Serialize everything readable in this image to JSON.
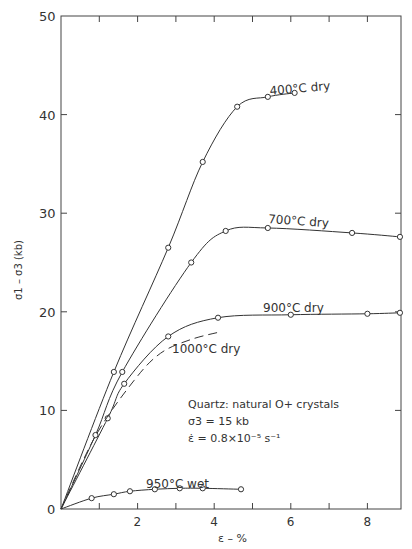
{
  "chart_data": {
    "type": "line",
    "title": "",
    "xlabel": "ε – %",
    "ylabel": "σ1 – σ3 (kb)",
    "xlim": [
      0,
      8.85
    ],
    "ylim": [
      0,
      50
    ],
    "xticks": [
      0,
      1,
      2,
      3,
      4,
      5,
      6,
      7,
      8
    ],
    "xtick_labels": [
      "",
      "",
      "2",
      "",
      "4",
      "",
      "6",
      "",
      "8"
    ],
    "yticks": [
      0,
      10,
      20,
      30,
      40,
      50
    ],
    "ytick_labels": [
      "0",
      "10",
      "20",
      "30",
      "40",
      "50"
    ],
    "grid": false,
    "legend": "none (inline curve labels)",
    "annotation": {
      "line1": "Quartz: natural O+ crystals",
      "line2": "σ3 = 15 kb",
      "line3": "ε̇ = 0.8×10⁻⁵ s⁻¹"
    },
    "series": [
      {
        "name": "400°C dry",
        "style": "solid",
        "x": [
          0,
          1.38,
          2.8,
          3.7,
          4.6,
          5.4,
          6.1
        ],
        "y": [
          0,
          13.9,
          26.5,
          35.2,
          40.8,
          41.8,
          42.2
        ]
      },
      {
        "name": "700°C dry",
        "style": "solid",
        "x": [
          0,
          0.9,
          1.6,
          3.4,
          4.3,
          5.4,
          7.6,
          8.85
        ],
        "y": [
          0,
          7.5,
          13.9,
          25.0,
          28.2,
          28.5,
          28.0,
          27.6
        ]
      },
      {
        "name": "900°C dry",
        "style": "solid",
        "x": [
          0,
          1.22,
          1.65,
          2.8,
          4.1,
          6.0,
          8.0,
          8.85
        ],
        "y": [
          0,
          9.2,
          12.7,
          17.5,
          19.4,
          19.7,
          19.8,
          19.9
        ]
      },
      {
        "name": "1000°C dry",
        "style": "dashed",
        "x": [
          0,
          0.9,
          1.9,
          2.6,
          3.4,
          4.2
        ],
        "y": [
          0,
          7.4,
          13.0,
          15.8,
          17.2,
          18.0
        ]
      },
      {
        "name": "950°C wet",
        "style": "solid",
        "x": [
          0,
          0.8,
          1.38,
          1.8,
          2.45,
          3.1,
          3.7,
          4.7
        ],
        "y": [
          0,
          1.1,
          1.5,
          1.8,
          2.0,
          2.1,
          2.1,
          2.0
        ]
      }
    ]
  },
  "labels": {
    "s400": "400°C dry",
    "s700": "700°C dry",
    "s900": "900°C dry",
    "s1000": "1000°C dry",
    "s950": "950°C wet",
    "xlabel": "ε – %",
    "ylabel": "σ1 – σ3 (kb)",
    "ann1": "Quartz: natural O+ crystals",
    "ann2": "σ3 = 15 kb",
    "ann3": "ε̇ = 0.8×10⁻⁵ s⁻¹"
  }
}
